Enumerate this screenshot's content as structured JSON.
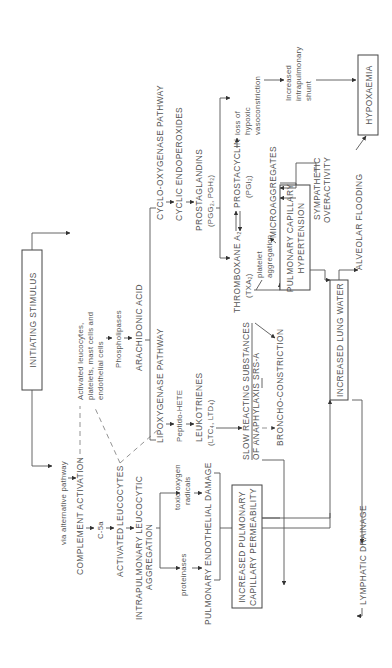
{
  "diagram": {
    "orientation": "rotated-90-ccw",
    "colors": {
      "line": "#555555",
      "text": "#555555",
      "background": "#ffffff"
    },
    "nodes": {
      "initiating_stimulus": "INITIATING STIMULUS",
      "via_alternative_pathway": "via alternative pathway",
      "complement_activation": "COMPLEMENT ACTIVATION",
      "c5a": "C-5a",
      "activated_leucocytes_label": "ACTIVATED",
      "activated_leucocytes": "LEUCOCYTES",
      "intrapulmonary_1": "INTRAPULMONARY LEUCOCYTIC",
      "intrapulmonary_2": "AGGREGATION",
      "toxic_oxygen_1": "toxic oxygen",
      "toxic_oxygen_2": "radicals",
      "proteinases": "proteinases",
      "endothelial_damage": "PULMONARY ENDOTHELIAL DAMAGE",
      "perm_1": "INCREASED PULMONARY",
      "perm_2": "CAPILLARY PERMEABILITY",
      "lymphatic_drainage": "LYMPHATIC DRAINAGE",
      "activated_cells_1": "Activated leucocytes,",
      "activated_cells_2": "platelets, mast cells and",
      "activated_cells_3": "endothelial cells",
      "phospholipases": "Phospholipases",
      "arachidonic_acid": "ARACHIDONIC ACID",
      "lipoxygenase": "LIPOXYGENASE PATHWAY",
      "peptido_hete": "Peptido-HETE",
      "leukotrienes_1": "LEUKOTRIENES",
      "leukotrienes_2": "(LTC₄, LTD₄)",
      "srs_1": "SLOW REACTING SUBSTANCES",
      "srs_2": "OF ANAPHYLAXIS SRS-A",
      "bronchoconstriction": "BRONCHO-CONSTRICTION",
      "cyclooxygenase": "CYCLO-OXYGENASE PATHWAY",
      "cyclic_endoperoxides": "CYCLIC ENDOPEROXIDES",
      "prostaglandins_1": "PROSTAGLANDINS",
      "prostaglandins_2": "(PGG₂, PGH₂)",
      "thromboxane_1": "THROMBOXANE A₂",
      "thromboxane_2": "(TXA₂)",
      "prostacyclin_1": "PROSTACYCLIN",
      "prostacyclin_2": "(PGI₂)",
      "platelet_aggregation_1": "platelet",
      "platelet_aggregation_2": "aggregation",
      "microaggregates": "MICROAGGREGATES",
      "loss_hypoxic_1": "loss of",
      "loss_hypoxic_2": "hypoxic",
      "loss_hypoxic_3": "vasoconstriction",
      "shunt_1": "Increased",
      "shunt_2": "intrapulmonary",
      "shunt_3": "shunt",
      "sympathetic_1": "SYMPATHETIC",
      "sympathetic_2": "OVERACTIVITY",
      "hypertension_1": "PULMONARY CAPILLARY",
      "hypertension_2": "HYPERTENSION",
      "lung_water": "INCREASED LUNG WATER",
      "alveolar_flooding": "ALVEOLAR FLOODING",
      "hypoxaemia": "HYPOXAEMIA"
    }
  }
}
